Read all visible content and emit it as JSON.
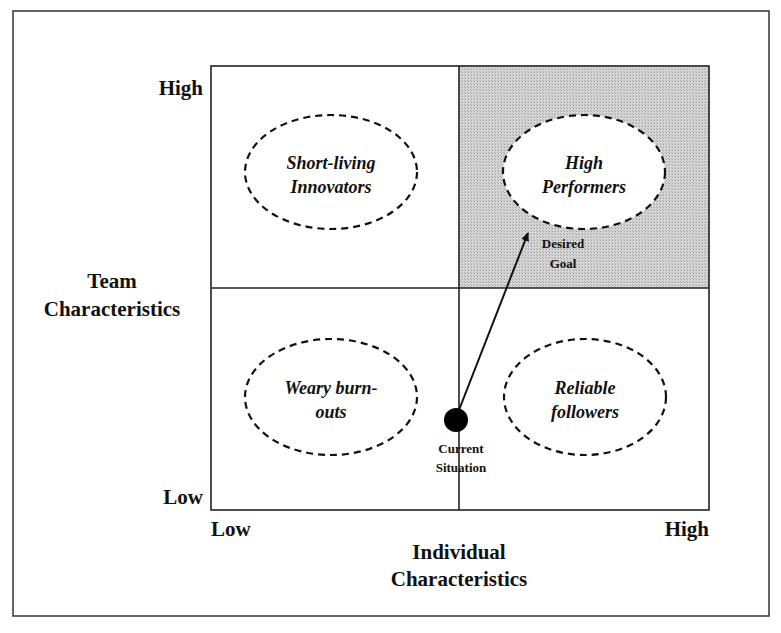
{
  "diagram": {
    "type": "2x2 matrix",
    "y_axis": {
      "title_lines": [
        "Team",
        "Characteristics"
      ],
      "low_label": "Low",
      "high_label": "High"
    },
    "x_axis": {
      "title_lines": [
        "Individual",
        "Characteristics"
      ],
      "low_label": "Low",
      "high_label": "High"
    },
    "quadrants": [
      {
        "position": "top-left",
        "lines": [
          "Short-living",
          "Innovators"
        ],
        "highlighted": false
      },
      {
        "position": "top-right",
        "lines": [
          "High",
          "Performers"
        ],
        "highlighted": true
      },
      {
        "position": "bottom-left",
        "lines": [
          "Weary burn-",
          "outs"
        ],
        "highlighted": false
      },
      {
        "position": "bottom-right",
        "lines": [
          "Reliable",
          "followers"
        ],
        "highlighted": false
      }
    ],
    "current_point": {
      "lines": [
        "Current",
        "Situation"
      ]
    },
    "goal_point": {
      "lines": [
        "Desired",
        "Goal"
      ]
    },
    "colors": {
      "border": "#222222",
      "highlight_fill": "#cfcfcf",
      "ellipse_fill": "#ffffff",
      "dot": "#000000"
    }
  }
}
